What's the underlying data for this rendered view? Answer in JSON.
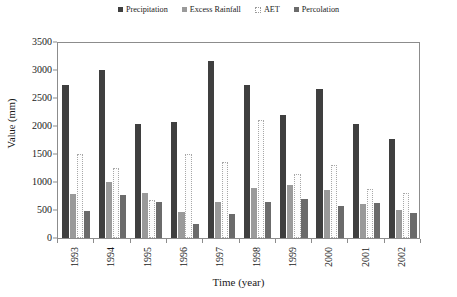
{
  "chart_data": {
    "type": "bar",
    "title": "",
    "xlabel": "Time (year)",
    "ylabel": "Value (mm)",
    "ylim": [
      0,
      3500
    ],
    "yticks": [
      0,
      500,
      1000,
      1500,
      2000,
      2500,
      3000,
      3500
    ],
    "ytick_labels": [
      "0",
      "500",
      "1000",
      "1500",
      "2000",
      "2500",
      "3000",
      "3500"
    ],
    "grid": false,
    "legend_position": "top",
    "categories": [
      "1993",
      "1994",
      "1995",
      "1996",
      "1997",
      "1998",
      "1999",
      "2000",
      "2001",
      "2002"
    ],
    "series": [
      {
        "name": "Precipitation",
        "color": "#3f3f3f",
        "style": "solid",
        "values": [
          2730,
          3000,
          2030,
          2080,
          3160,
          2730,
          2200,
          2660,
          2040,
          1770
        ]
      },
      {
        "name": "Excess Rainfall",
        "color": "#9a9a9a",
        "style": "solid",
        "values": [
          790,
          1000,
          800,
          470,
          640,
          900,
          950,
          850,
          600,
          500
        ]
      },
      {
        "name": "AET",
        "color": "#ffffff",
        "style": "dotted-outline",
        "values": [
          1500,
          1250,
          680,
          1500,
          1350,
          2100,
          1150,
          1300,
          870,
          800
        ]
      },
      {
        "name": "Percolation",
        "color": "#6b6b6b",
        "style": "solid",
        "values": [
          480,
          760,
          650,
          250,
          420,
          650,
          700,
          580,
          620,
          450
        ]
      }
    ]
  },
  "legend": {
    "items": [
      {
        "label": "Precipitation",
        "swatch": "precip-swatch-icon"
      },
      {
        "label": "Excess Rainfall",
        "swatch": "excess-rainfall-swatch-icon"
      },
      {
        "label": "AET",
        "swatch": "aet-swatch-icon"
      },
      {
        "label": "Percolation",
        "swatch": "percolation-swatch-icon"
      }
    ]
  }
}
